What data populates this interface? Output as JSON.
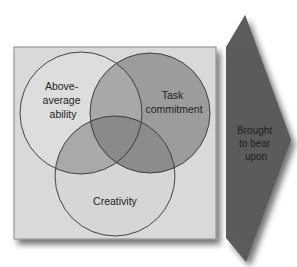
{
  "diagram": {
    "type": "venn-with-arrow",
    "circles": [
      {
        "id": "ability",
        "label_lines": [
          "Above-",
          "average",
          "ability"
        ],
        "cx": 81,
        "cy": 113,
        "r": 61,
        "fill": "#dddddd"
      },
      {
        "id": "task",
        "label_lines": [
          "Task",
          "commitment"
        ],
        "cx": 150,
        "cy": 113,
        "r": 60,
        "fill": "#9c9c9c"
      },
      {
        "id": "creativity",
        "label_lines": [
          "Creativity"
        ],
        "cx": 115,
        "cy": 176,
        "r": 60,
        "fill": "#d6d6d6"
      }
    ],
    "arrow": {
      "label_lines": [
        "Brought",
        "to bear",
        "upon"
      ],
      "fill": "#5b5b5b"
    },
    "colors": {
      "box_background": "#d9d9d9",
      "box_border": "#8a8a8a",
      "circle_stroke": "#333333",
      "overlap_ability_task": "#a8a8a8",
      "overlap_ability_creativity": "#a9a9a9",
      "overlap_task_creativity": "#8c8c8c",
      "overlap_all": "#8a8a8a"
    }
  }
}
